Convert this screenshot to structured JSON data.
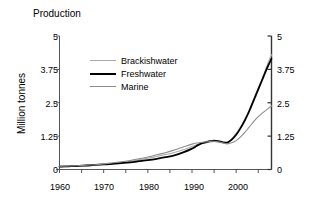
{
  "chart_data": {
    "type": "line",
    "title": "Production",
    "xlabel": "",
    "ylabel": "Million tonnes",
    "xlim": [
      1960,
      2008
    ],
    "ylim": [
      0,
      5
    ],
    "xticks": [
      1960,
      1965,
      1970,
      1975,
      1980,
      1985,
      1990,
      1995,
      2000,
      2005
    ],
    "xticklabels": [
      "1960",
      "",
      "1970",
      "",
      "1980",
      "",
      "1990",
      "",
      "2000",
      ""
    ],
    "yticks": [
      0,
      1.25,
      2.5,
      3.75,
      5
    ],
    "yticklabels": [
      "0",
      "1.25",
      "2.5",
      "3.75",
      "5"
    ],
    "grid": false,
    "legend_position": "upper-left-inside",
    "right_axis_mirrored": true,
    "right_yticklabels": [
      "0",
      "1.25",
      "2.5",
      "3.75",
      "5"
    ],
    "x": [
      1960,
      1962,
      1964,
      1966,
      1968,
      1970,
      1972,
      1974,
      1976,
      1978,
      1980,
      1982,
      1984,
      1986,
      1988,
      1990,
      1991,
      1992,
      1993,
      1994,
      1995,
      1996,
      1997,
      1998,
      1999,
      2000,
      2001,
      2002,
      2003,
      2004,
      2005,
      2006,
      2007,
      2008
    ],
    "series": [
      {
        "name": "Brackishwater",
        "color": "#A9A9A9",
        "width": 1.1,
        "values": [
          0.1,
          0.11,
          0.12,
          0.14,
          0.16,
          0.19,
          0.22,
          0.26,
          0.31,
          0.36,
          0.42,
          0.49,
          0.56,
          0.64,
          0.74,
          0.86,
          0.92,
          0.96,
          0.99,
          1.02,
          1.05,
          1.02,
          0.99,
          1.0,
          1.15,
          1.35,
          1.6,
          1.9,
          2.25,
          2.65,
          3.05,
          3.45,
          3.9,
          4.3
        ]
      },
      {
        "name": "Freshwater",
        "color": "#000000",
        "width": 1.8,
        "values": [
          0.11,
          0.12,
          0.13,
          0.15,
          0.17,
          0.19,
          0.21,
          0.24,
          0.27,
          0.31,
          0.35,
          0.4,
          0.46,
          0.53,
          0.64,
          0.78,
          0.88,
          0.97,
          1.02,
          1.06,
          1.08,
          1.06,
          1.02,
          1.01,
          1.12,
          1.3,
          1.55,
          1.85,
          2.2,
          2.6,
          3.0,
          3.4,
          3.8,
          4.15
        ]
      },
      {
        "name": "Marine",
        "color": "#8C8C8C",
        "width": 1.1,
        "values": [
          0.12,
          0.13,
          0.14,
          0.16,
          0.18,
          0.21,
          0.25,
          0.29,
          0.34,
          0.4,
          0.47,
          0.55,
          0.63,
          0.73,
          0.84,
          0.95,
          0.99,
          1.01,
          1.03,
          1.05,
          1.06,
          1.04,
          1.0,
          0.96,
          1.0,
          1.08,
          1.22,
          1.4,
          1.6,
          1.8,
          1.98,
          2.12,
          2.25,
          2.38
        ]
      }
    ]
  },
  "axes": {
    "left_labels": [
      "5",
      "3.75",
      "2.5",
      "1.25",
      "0"
    ],
    "right_labels": [
      "5",
      "3.75",
      "2.5",
      "1.25",
      "0"
    ],
    "x_labels": [
      "1960",
      "1970",
      "1980",
      "1990",
      "2000"
    ]
  },
  "legend": {
    "items": [
      {
        "label": "Brackishwater",
        "color": "#A9A9A9"
      },
      {
        "label": "Freshwater",
        "color": "#000000"
      },
      {
        "label": "Marine",
        "color": "#8C8C8C"
      }
    ]
  }
}
